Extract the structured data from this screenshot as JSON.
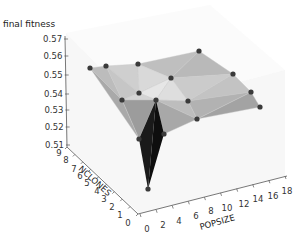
{
  "chart_data": {
    "type": "surface3d",
    "title": "",
    "xlabel": "POPSIZE",
    "ylabel": "NCLONES",
    "zlabel": "final fitness",
    "x_ticks": [
      "0",
      "2",
      "4",
      "6",
      "8",
      "10",
      "12",
      "14",
      "16",
      "18"
    ],
    "y_ticks": [
      "0",
      "1",
      "2",
      "3",
      "4",
      "5",
      "6",
      "7",
      "8",
      "9"
    ],
    "z_ticks": [
      "0.51",
      "0.52",
      "0.53",
      "0.54",
      "0.55",
      "0.56",
      "0.57"
    ],
    "xlim": [
      0,
      18
    ],
    "ylim": [
      0,
      9
    ],
    "zlim": [
      0.51,
      0.57
    ],
    "grid": true,
    "legend": null,
    "surface": "triangulated grayscale surface with dark markers at data points",
    "points_description": "Mostly plateau around 0.545-0.56 across POPSIZE and NCLONES; a sharp downward spike near POPSIZE≈2, NCLONES≈0 reaching ≈0.51",
    "approx_points": [
      {
        "popsize": 2,
        "nclones": 9,
        "fitness": 0.553
      },
      {
        "popsize": 4,
        "nclones": 9,
        "fitness": 0.553
      },
      {
        "popsize": 8,
        "nclones": 9,
        "fitness": 0.553
      },
      {
        "popsize": 18,
        "nclones": 9,
        "fitness": 0.558
      },
      {
        "popsize": 18,
        "nclones": 5,
        "fitness": 0.553
      },
      {
        "popsize": 18,
        "nclones": 2,
        "fitness": 0.549
      },
      {
        "popsize": 18,
        "nclones": 0,
        "fitness": 0.547
      },
      {
        "popsize": 10,
        "nclones": 5,
        "fitness": 0.553
      },
      {
        "popsize": 6,
        "nclones": 5,
        "fitness": 0.548
      },
      {
        "popsize": 12,
        "nclones": 2,
        "fitness": 0.546
      },
      {
        "popsize": 2,
        "nclones": 4,
        "fitness": 0.547
      },
      {
        "popsize": 6,
        "nclones": 2,
        "fitness": 0.546
      },
      {
        "popsize": 12,
        "nclones": 0,
        "fitness": 0.543
      },
      {
        "popsize": 2,
        "nclones": 0,
        "fitness": 0.54
      },
      {
        "popsize": 6,
        "nclones": 0,
        "fitness": 0.54
      },
      {
        "popsize": 4,
        "nclones": 0,
        "fitness": 0.515
      }
    ]
  },
  "labels": {
    "zlabel": "final fitness",
    "xlabel": "POPSIZE",
    "ylabel": "NCLONES"
  },
  "colors": {
    "marker": "#3a3a3a",
    "spike": "#161616",
    "face_light": "#d8d8d8",
    "face_mid": "#b4b4b4",
    "face_dark": "#969696",
    "axis": "#555555"
  }
}
